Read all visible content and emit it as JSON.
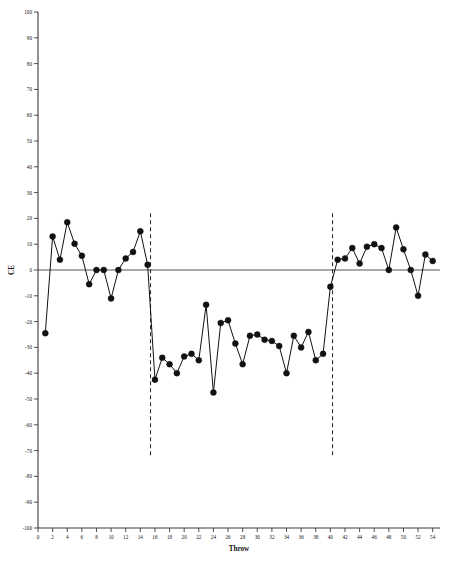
{
  "chart_data": {
    "type": "line",
    "title": "",
    "subtitle": "",
    "xlabel": "Throw",
    "ylabel": "CE",
    "xlim": [
      0,
      55
    ],
    "ylim": [
      -100,
      100
    ],
    "grid": false,
    "legend": null,
    "x_ticks": [
      0,
      2,
      4,
      6,
      8,
      10,
      12,
      14,
      16,
      18,
      20,
      22,
      24,
      26,
      28,
      30,
      32,
      34,
      36,
      38,
      40,
      42,
      44,
      46,
      48,
      50,
      52,
      54
    ],
    "y_ticks": [
      100,
      90,
      80,
      70,
      60,
      50,
      40,
      30,
      20,
      10,
      0,
      -10,
      -20,
      -30,
      -40,
      -50,
      -60,
      -70,
      -80,
      -90,
      -100
    ],
    "zero_line": 0,
    "phase_dividers": [
      15.4,
      40.3
    ],
    "marker": "filled-circle",
    "series": [
      {
        "name": "CE",
        "x": [
          1,
          2,
          3,
          4,
          5,
          6,
          7,
          8,
          9,
          10,
          11,
          12,
          13,
          14,
          15,
          16,
          17,
          18,
          19,
          20,
          21,
          22,
          23,
          24,
          25,
          26,
          27,
          28,
          29,
          30,
          31,
          32,
          33,
          34,
          35,
          36,
          37,
          38,
          39,
          40,
          41,
          42,
          43,
          44,
          45,
          46,
          47,
          48,
          49,
          50,
          51,
          52,
          53,
          54
        ],
        "values": [
          -24.5,
          13.0,
          4.0,
          18.5,
          10.2,
          5.5,
          -5.5,
          0.0,
          0.0,
          -11.0,
          0.0,
          4.5,
          7.0,
          15.0,
          2.0,
          -42.5,
          -34.0,
          -36.5,
          -40.0,
          -33.5,
          -32.5,
          -35.0,
          -13.5,
          -47.5,
          -20.5,
          -19.5,
          -28.5,
          -36.5,
          -25.5,
          -25.0,
          -27.0,
          -27.5,
          -29.5,
          -40.0,
          -25.5,
          -30.0,
          -24.0,
          -35.0,
          -32.5,
          -6.5,
          4.0,
          4.5,
          8.5,
          2.5,
          9.0,
          10.0,
          8.5,
          0.0,
          16.5,
          8.0,
          0.0,
          -10.0,
          6.0,
          3.5
        ]
      }
    ]
  },
  "axis": {
    "x_title": "Throw",
    "y_title": "CE"
  }
}
